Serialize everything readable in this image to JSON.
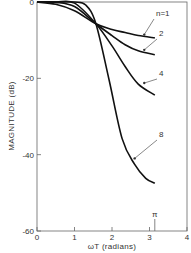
{
  "chart_data": {
    "type": "line",
    "title": "",
    "xlabel": "ωT (radians)",
    "ylabel": "MAGNITUDE (dB)",
    "xlim": [
      0,
      4
    ],
    "ylim": [
      -60,
      0
    ],
    "x_ticks": [
      "0",
      "1",
      "2",
      "3",
      "4"
    ],
    "y_ticks": [
      "0",
      "-20",
      "-40",
      "-60"
    ],
    "annotations": [
      {
        "text": "π",
        "x": 3.1416
      }
    ],
    "grid": false,
    "legend": "inline labels with leader arrows",
    "series": [
      {
        "name": "n=1",
        "label": "n=1",
        "x": [
          0,
          0.5,
          1.0,
          1.5708,
          2.0,
          2.35,
          2.7,
          3.1416
        ],
        "y": [
          0,
          -0.6,
          -2.3,
          -5.7,
          -7.2,
          -8.0,
          -8.8,
          -9.4
        ]
      },
      {
        "name": "n=2",
        "label": "2",
        "x": [
          0,
          0.5,
          1.0,
          1.5708,
          2.0,
          2.35,
          2.7,
          3.1416
        ],
        "y": [
          0,
          -0.1,
          -1.2,
          -5.7,
          -8.8,
          -11.2,
          -12.8,
          -13.8
        ]
      },
      {
        "name": "n=4",
        "label": "4",
        "x": [
          0,
          0.5,
          1.0,
          1.5708,
          2.0,
          2.35,
          2.7,
          3.1416
        ],
        "y": [
          0,
          0,
          -0.3,
          -5.7,
          -11.5,
          -16.9,
          -21.5,
          -24.4
        ]
      },
      {
        "name": "n=8",
        "label": "8",
        "x": [
          0,
          0.5,
          1.0,
          1.3,
          1.5708,
          1.92,
          2.27,
          2.6,
          2.9,
          3.1416
        ],
        "y": [
          0,
          0,
          0,
          -0.8,
          -5.7,
          -20.3,
          -35.8,
          -42.5,
          -46.2,
          -47.5
        ]
      }
    ]
  }
}
